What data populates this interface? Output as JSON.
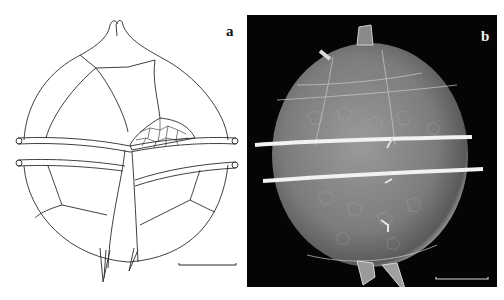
{
  "figure": {
    "panels": [
      {
        "id": "a",
        "label": "a",
        "type": "line-drawing",
        "background": "#ffffff",
        "line_color": "#222222",
        "scale_bar": true
      },
      {
        "id": "b",
        "label": "b",
        "type": "SEM-micrograph",
        "background": "#050505",
        "scale_bar": true
      }
    ]
  }
}
